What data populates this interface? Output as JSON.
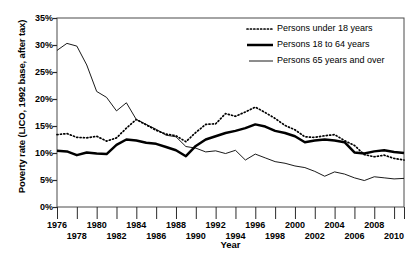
{
  "chart_data": {
    "type": "line",
    "title": "",
    "xlabel": "Year",
    "ylabel": "Poverty rate (LICO, 1992 base, after tax)",
    "xlim": [
      1976,
      2011
    ],
    "ylim": [
      0,
      35
    ],
    "y_tick_labels": [
      "35%",
      "30%",
      "25%",
      "20%",
      "15%",
      "10%",
      "5%",
      "0%"
    ],
    "y_tick_values": [
      35,
      30,
      25,
      20,
      15,
      10,
      5,
      0
    ],
    "y_tick_suffix": "%",
    "x_tick_values": [
      1976,
      1978,
      1980,
      1982,
      1984,
      1986,
      1988,
      1990,
      1992,
      1994,
      1996,
      1998,
      2000,
      2002,
      2004,
      2006,
      2008,
      2010
    ],
    "x_tick_labels_row1": [
      "1976",
      "1980",
      "1984",
      "1988",
      "1992",
      "1996",
      "2000",
      "2004",
      "2008"
    ],
    "x_tick_labels_row2": [
      "1978",
      "1982",
      "1986",
      "1990",
      "1994",
      "1998",
      "2002",
      "2006",
      "2010"
    ],
    "grid": false,
    "legend_position": "top-right",
    "x": [
      1976,
      1977,
      1978,
      1979,
      1980,
      1981,
      1982,
      1983,
      1984,
      1985,
      1986,
      1987,
      1988,
      1989,
      1990,
      1991,
      1992,
      1993,
      1994,
      1995,
      1996,
      1997,
      1998,
      1999,
      2000,
      2001,
      2002,
      2003,
      2004,
      2005,
      2006,
      2007,
      2008,
      2009,
      2010,
      2011
    ],
    "series": [
      {
        "name": "Persons under 18 years",
        "style": "dotted",
        "color": "#000000",
        "values": [
          13.4,
          13.6,
          12.9,
          12.8,
          13.1,
          12.2,
          12.8,
          14.6,
          16.2,
          15.2,
          14.2,
          13.5,
          13.2,
          12.1,
          13.8,
          15.3,
          15.4,
          17.3,
          16.8,
          17.6,
          18.5,
          17.5,
          16.4,
          15.1,
          14.3,
          13.0,
          12.9,
          13.2,
          13.4,
          12.3,
          11.4,
          9.7,
          9.3,
          9.6,
          9.0,
          8.7
        ]
      },
      {
        "name": "Persons 18 to 64 years",
        "style": "thick-solid",
        "color": "#000000",
        "values": [
          10.4,
          10.3,
          9.6,
          10.1,
          9.9,
          9.8,
          11.5,
          12.5,
          12.3,
          11.9,
          11.7,
          11.1,
          10.5,
          9.4,
          11.3,
          12.5,
          13.1,
          13.7,
          14.1,
          14.6,
          15.3,
          14.9,
          14.1,
          13.7,
          13.1,
          12.0,
          12.3,
          12.5,
          12.3,
          12.0,
          10.1,
          9.9,
          10.3,
          10.5,
          10.2,
          10.0
        ]
      },
      {
        "name": "Persons 65 years and over",
        "style": "thin-solid",
        "color": "#000000",
        "values": [
          29.0,
          30.3,
          29.8,
          26.3,
          21.4,
          20.3,
          17.8,
          19.3,
          16.2,
          15.3,
          14.4,
          13.3,
          13.0,
          11.2,
          10.9,
          10.2,
          10.4,
          9.9,
          10.5,
          8.7,
          9.8,
          9.1,
          8.4,
          8.1,
          7.6,
          7.3,
          6.6,
          5.7,
          6.5,
          6.1,
          5.4,
          4.9,
          5.6,
          5.4,
          5.2,
          5.3
        ]
      }
    ]
  },
  "legend": {
    "items": [
      {
        "label": "Persons under 18 years",
        "style": "dotted"
      },
      {
        "label": "Persons 18 to 64 years",
        "style": "thick-solid"
      },
      {
        "label": "Persons 65 years and over",
        "style": "thin-solid"
      }
    ]
  }
}
